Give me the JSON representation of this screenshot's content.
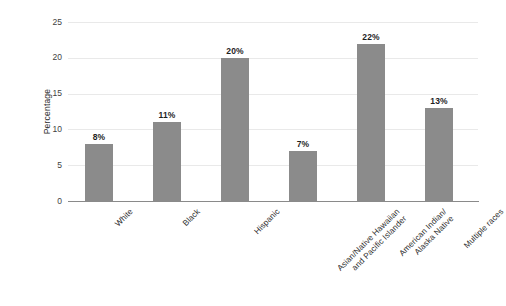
{
  "chart_data": {
    "type": "bar",
    "title": "",
    "xlabel": "",
    "ylabel": "Percentage",
    "ylim": [
      0,
      25
    ],
    "yticks": [
      0,
      5,
      10,
      15,
      20,
      25
    ],
    "grid": true,
    "legend": null,
    "categories": [
      "White",
      "Black",
      "Hispanic",
      "Asian/Native Hawaiian\nand Pacific Islander",
      "American Indian/\nAlaska Native",
      "Multiple races"
    ],
    "values": [
      8,
      11,
      20,
      7,
      22,
      13
    ],
    "data_labels": [
      "8%",
      "11%",
      "20%",
      "7%",
      "22%",
      "13%"
    ],
    "bar_color": "#8b8b8b",
    "gridline_color": "#e9e9e9",
    "axis_color": "#8a8a8a",
    "background_color": "#ffffff"
  },
  "axis": {
    "y_tick_labels": [
      "25",
      "20",
      "15",
      "10",
      "5",
      "0"
    ],
    "y_title": "Percentage"
  }
}
